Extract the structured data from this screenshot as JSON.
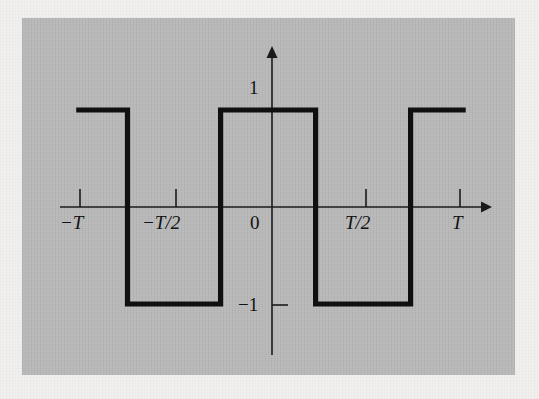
{
  "figure": {
    "background_color": "#f1f0ee",
    "panel_color": "#b9b9b9",
    "ink_color": "#101010",
    "axis_color": "#1b1b1b"
  },
  "axes": {
    "x_axis_name": "time-axis",
    "y_axis_name": "amplitude-axis",
    "x_ticks": [
      {
        "label": "−T",
        "value": -1,
        "style": "italic"
      },
      {
        "label": "−T/2",
        "value": -0.5,
        "style": "italic"
      },
      {
        "label": "T/2",
        "value": 0.5,
        "style": "italic"
      },
      {
        "label": "T",
        "value": 1,
        "style": "italic"
      }
    ],
    "y_ticks": [
      {
        "label": "1",
        "value": 1,
        "style": "upright"
      },
      {
        "label": "−1",
        "value": -1,
        "style": "upright"
      }
    ],
    "origin_label": "0",
    "xlim": [
      -1.25,
      1.28
    ],
    "ylim": [
      -1.55,
      1.55
    ]
  },
  "chart_data": {
    "type": "line",
    "title": "",
    "subtitle": "",
    "xlabel": "",
    "ylabel": "",
    "grid": false,
    "legend": null,
    "annotations": [],
    "xlim": [
      -1.25,
      1.28
    ],
    "ylim": [
      -1.55,
      1.55
    ],
    "xticks": [
      -1,
      -0.5,
      0.5,
      1
    ],
    "xticklabels": [
      "−T",
      "−T/2",
      "T/2",
      "T"
    ],
    "yticks": [
      -1,
      1
    ],
    "yticklabels": [
      "−1",
      "1"
    ],
    "series": [
      {
        "name": "square-wave",
        "description": "Periodic square wave of period T, amplitude 1, odd-symmetric about the origin with value +1 on (-T/4, T/4)",
        "waveform": "square",
        "period": 1,
        "amplitude": 1,
        "duty_cycle": 0.5,
        "x": [
          -1.02,
          -0.75,
          -0.75,
          -0.26,
          -0.26,
          0.24,
          0.24,
          0.74,
          0.74,
          1.03
        ],
        "y": [
          1,
          1,
          -1,
          -1,
          1,
          1,
          -1,
          -1,
          1,
          1
        ]
      }
    ]
  },
  "geometry": {
    "x_axis_y_px": 207,
    "y_axis_x_px": 272,
    "level_high_y_px": 110,
    "level_low_y_px": 305,
    "x_axis_start_px": 60,
    "x_axis_end_px": 487,
    "y_axis_top_px": 48,
    "y_axis_bottom_px": 355,
    "tick_px": {
      "minusT": 80,
      "minusThalf": 176,
      "Thalf": 366,
      "T": 460
    },
    "edges_px": [
      80,
      130,
      223,
      317,
      412,
      465
    ]
  }
}
